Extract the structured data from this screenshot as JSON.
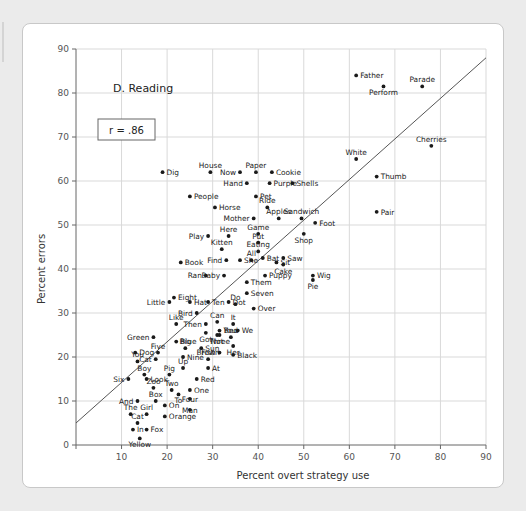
{
  "chart_data": {
    "type": "scatter",
    "title": "D. Reading",
    "xlabel": "Percent overt strategy use",
    "ylabel": "Percent errors",
    "xlim": [
      0,
      90
    ],
    "ylim": [
      0,
      90
    ],
    "xticks": [
      0,
      10,
      20,
      30,
      40,
      50,
      60,
      70,
      80,
      90
    ],
    "yticks": [
      0,
      10,
      20,
      30,
      40,
      50,
      60,
      70,
      80,
      90
    ],
    "grid": true,
    "legend": "none",
    "annotation": "r = .86",
    "correlation": 0.86,
    "trendline": {
      "x": [
        0,
        90
      ],
      "y": [
        5,
        88
      ]
    },
    "points": [
      {
        "label": "Father",
        "x": 61.5,
        "y": 84.0,
        "lpos": "right"
      },
      {
        "label": "Perform",
        "x": 67.5,
        "y": 81.5,
        "lpos": "below"
      },
      {
        "label": "Parade",
        "x": 76.0,
        "y": 81.5,
        "lpos": "above"
      },
      {
        "label": "Cherries",
        "x": 78.0,
        "y": 68.0,
        "lpos": "above"
      },
      {
        "label": "White",
        "x": 61.5,
        "y": 65.0,
        "lpos": "above"
      },
      {
        "label": "Thumb",
        "x": 66.0,
        "y": 61.0,
        "lpos": "right"
      },
      {
        "label": "Pair",
        "x": 66.0,
        "y": 53.0,
        "lpos": "right"
      },
      {
        "label": "Dig",
        "x": 19.0,
        "y": 62.0,
        "lpos": "right"
      },
      {
        "label": "House",
        "x": 29.5,
        "y": 62.0,
        "lpos": "above"
      },
      {
        "label": "Now",
        "x": 36.0,
        "y": 62.0,
        "lpos": "left"
      },
      {
        "label": "Paper",
        "x": 39.5,
        "y": 62.0,
        "lpos": "above"
      },
      {
        "label": "Cookie",
        "x": 43.0,
        "y": 62.0,
        "lpos": "right"
      },
      {
        "label": "Hand",
        "x": 37.5,
        "y": 59.5,
        "lpos": "left"
      },
      {
        "label": "Purple",
        "x": 42.5,
        "y": 59.5,
        "lpos": "right"
      },
      {
        "label": "Shells",
        "x": 47.5,
        "y": 59.5,
        "lpos": "right"
      },
      {
        "label": "People",
        "x": 25.0,
        "y": 56.5,
        "lpos": "right"
      },
      {
        "label": "Pet",
        "x": 39.5,
        "y": 56.5,
        "lpos": "right"
      },
      {
        "label": "Horse",
        "x": 30.5,
        "y": 54.0,
        "lpos": "right"
      },
      {
        "label": "Ride",
        "x": 42.0,
        "y": 54.0,
        "lpos": "above"
      },
      {
        "label": "Mother",
        "x": 39.0,
        "y": 51.5,
        "lpos": "left"
      },
      {
        "label": "Apples",
        "x": 44.5,
        "y": 51.5,
        "lpos": "above"
      },
      {
        "label": "Sandwich",
        "x": 49.5,
        "y": 51.5,
        "lpos": "above"
      },
      {
        "label": "Foot",
        "x": 52.5,
        "y": 50.5,
        "lpos": "right"
      },
      {
        "label": "Here",
        "x": 33.5,
        "y": 47.5,
        "lpos": "above"
      },
      {
        "label": "Game",
        "x": 40.0,
        "y": 48.0,
        "lpos": "above"
      },
      {
        "label": "Shop",
        "x": 50.0,
        "y": 48.0,
        "lpos": "below"
      },
      {
        "label": "Play",
        "x": 29.0,
        "y": 47.5,
        "lpos": "left"
      },
      {
        "label": "Put",
        "x": 40.0,
        "y": 46.0,
        "lpos": "above"
      },
      {
        "label": "Kitten",
        "x": 32.0,
        "y": 44.5,
        "lpos": "above"
      },
      {
        "label": "Eating",
        "x": 40.0,
        "y": 44.0,
        "lpos": "above"
      },
      {
        "label": "Bat",
        "x": 41.0,
        "y": 42.5,
        "lpos": "right"
      },
      {
        "label": "Saw",
        "x": 45.5,
        "y": 42.5,
        "lpos": "right"
      },
      {
        "label": "Find",
        "x": 33.0,
        "y": 42.0,
        "lpos": "left"
      },
      {
        "label": "She",
        "x": 36.0,
        "y": 42.0,
        "lpos": "right"
      },
      {
        "label": "All",
        "x": 38.5,
        "y": 42.0,
        "lpos": "above"
      },
      {
        "label": "Sit",
        "x": 44.0,
        "y": 41.5,
        "lpos": "right"
      },
      {
        "label": "Cake",
        "x": 45.5,
        "y": 41.0,
        "lpos": "below"
      },
      {
        "label": "Book",
        "x": 23.0,
        "y": 41.5,
        "lpos": "right"
      },
      {
        "label": "Ran",
        "x": 28.5,
        "y": 38.5,
        "lpos": "left"
      },
      {
        "label": "Baby",
        "x": 32.5,
        "y": 38.5,
        "lpos": "left"
      },
      {
        "label": "Puppy",
        "x": 41.5,
        "y": 38.5,
        "lpos": "right"
      },
      {
        "label": "Wig",
        "x": 52.0,
        "y": 38.5,
        "lpos": "right"
      },
      {
        "label": "Pie",
        "x": 52.0,
        "y": 37.5,
        "lpos": "below"
      },
      {
        "label": "Them",
        "x": 37.5,
        "y": 37.0,
        "lpos": "right"
      },
      {
        "label": "Seven",
        "x": 37.5,
        "y": 34.5,
        "lpos": "right"
      },
      {
        "label": "Eight",
        "x": 21.5,
        "y": 33.5,
        "lpos": "right"
      },
      {
        "label": "Hat",
        "x": 25.0,
        "y": 32.5,
        "lpos": "right"
      },
      {
        "label": "Ten",
        "x": 29.0,
        "y": 32.5,
        "lpos": "right"
      },
      {
        "label": "Little",
        "x": 20.5,
        "y": 32.5,
        "lpos": "left"
      },
      {
        "label": "Do",
        "x": 35.0,
        "y": 32.0,
        "lpos": "above"
      },
      {
        "label": "Over",
        "x": 39.0,
        "y": 31.0,
        "lpos": "right"
      },
      {
        "label": "Dot",
        "x": 33.5,
        "y": 32.5,
        "lpos": "right"
      },
      {
        "label": "Bird",
        "x": 26.5,
        "y": 30.0,
        "lpos": "left"
      },
      {
        "label": "Like",
        "x": 22.0,
        "y": 27.5,
        "lpos": "above"
      },
      {
        "label": "Then",
        "x": 28.5,
        "y": 27.5,
        "lpos": "left"
      },
      {
        "label": "Can",
        "x": 31.0,
        "y": 28.0,
        "lpos": "above"
      },
      {
        "label": "It",
        "x": 34.5,
        "y": 27.5,
        "lpos": "above"
      },
      {
        "label": "Your",
        "x": 31.5,
        "y": 26.0,
        "lpos": "right"
      },
      {
        "label": "Three",
        "x": 31.5,
        "y": 25.0,
        "lpos": "below"
      },
      {
        "label": "We",
        "x": 35.5,
        "y": 26.0,
        "lpos": "right"
      },
      {
        "label": "Got",
        "x": 28.5,
        "y": 25.5,
        "lpos": "below"
      },
      {
        "label": "Not",
        "x": 31.0,
        "y": 25.0,
        "lpos": "below"
      },
      {
        "label": "Bed",
        "x": 34.0,
        "y": 24.5,
        "lpos": "above"
      },
      {
        "label": "Green",
        "x": 17.0,
        "y": 24.5,
        "lpos": "left"
      },
      {
        "label": "Blue",
        "x": 22.0,
        "y": 23.5,
        "lpos": "right"
      },
      {
        "label": "Her",
        "x": 34.5,
        "y": 22.5,
        "lpos": "below"
      },
      {
        "label": "Big",
        "x": 24.0,
        "y": 22.0,
        "lpos": "above"
      },
      {
        "label": "Sun",
        "x": 27.5,
        "y": 22.0,
        "lpos": "right"
      },
      {
        "label": "Dog",
        "x": 13.0,
        "y": 21.0,
        "lpos": "right"
      },
      {
        "label": "Five",
        "x": 18.0,
        "y": 21.0,
        "lpos": "above"
      },
      {
        "label": "Fish",
        "x": 31.5,
        "y": 21.0,
        "lpos": "left"
      },
      {
        "label": "Black",
        "x": 34.5,
        "y": 20.5,
        "lpos": "right"
      },
      {
        "label": "Nine",
        "x": 23.5,
        "y": 20.0,
        "lpos": "right"
      },
      {
        "label": "Cat",
        "x": 17.5,
        "y": 19.5,
        "lpos": "left"
      },
      {
        "label": "You",
        "x": 13.5,
        "y": 19.0,
        "lpos": "above"
      },
      {
        "label": "Brown",
        "x": 29.0,
        "y": 19.5,
        "lpos": "above"
      },
      {
        "label": "Up",
        "x": 23.5,
        "y": 17.5,
        "lpos": "above"
      },
      {
        "label": "At",
        "x": 29.0,
        "y": 17.5,
        "lpos": "right"
      },
      {
        "label": "Boy",
        "x": 15.0,
        "y": 16.0,
        "lpos": "above"
      },
      {
        "label": "Pig",
        "x": 20.5,
        "y": 16.0,
        "lpos": "above"
      },
      {
        "label": "Six",
        "x": 11.5,
        "y": 15.0,
        "lpos": "left"
      },
      {
        "label": "Look",
        "x": 15.5,
        "y": 15.0,
        "lpos": "right"
      },
      {
        "label": "Red",
        "x": 26.5,
        "y": 15.0,
        "lpos": "right"
      },
      {
        "label": "Zoo",
        "x": 17.0,
        "y": 13.0,
        "lpos": "above"
      },
      {
        "label": "Two",
        "x": 21.0,
        "y": 12.5,
        "lpos": "above"
      },
      {
        "label": "One",
        "x": 25.0,
        "y": 12.5,
        "lpos": "right"
      },
      {
        "label": "To",
        "x": 22.5,
        "y": 11.5,
        "lpos": "below"
      },
      {
        "label": "And",
        "x": 13.5,
        "y": 10.0,
        "lpos": "left"
      },
      {
        "label": "Box",
        "x": 17.5,
        "y": 10.0,
        "lpos": "above"
      },
      {
        "label": "Four",
        "x": 25.0,
        "y": 10.5,
        "lpos": "none"
      },
      {
        "label": "On",
        "x": 19.5,
        "y": 9.0,
        "lpos": "right"
      },
      {
        "label": "Man",
        "x": 25.0,
        "y": 8.0,
        "lpos": "none"
      },
      {
        "label": "The",
        "x": 12.0,
        "y": 7.0,
        "lpos": "above"
      },
      {
        "label": "Girl",
        "x": 15.5,
        "y": 7.0,
        "lpos": "above"
      },
      {
        "label": "Orange",
        "x": 19.5,
        "y": 6.5,
        "lpos": "right"
      },
      {
        "label": "Cat2",
        "x": 13.5,
        "y": 5.0,
        "lpos": "above"
      },
      {
        "label": "In",
        "x": 12.5,
        "y": 3.5,
        "lpos": "right"
      },
      {
        "label": "Fox",
        "x": 15.5,
        "y": 3.5,
        "lpos": "right"
      },
      {
        "label": "Yellow",
        "x": 14.0,
        "y": 1.5,
        "lpos": "below"
      }
    ]
  }
}
